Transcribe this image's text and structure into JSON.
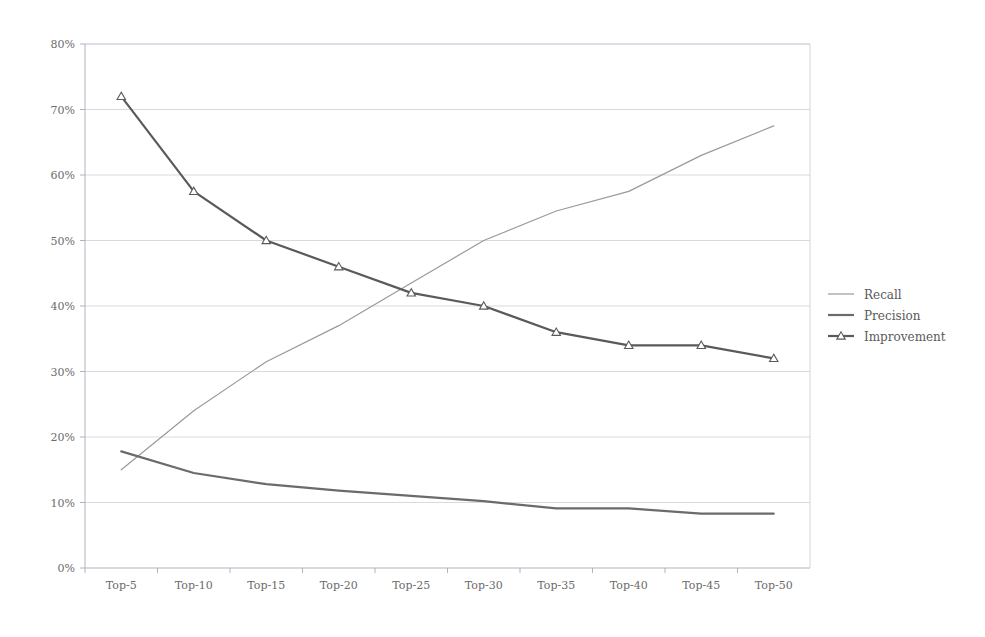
{
  "chart_data": {
    "type": "line",
    "title": "",
    "subtitle": "",
    "xlabel": "",
    "ylabel": "",
    "categories": [
      "Top-5",
      "Top-10",
      "Top-15",
      "Top-20",
      "Top-25",
      "Top-30",
      "Top-35",
      "Top-40",
      "Top-45",
      "Top-50"
    ],
    "ylim": [
      0,
      80
    ],
    "ytick_values": [
      0,
      10,
      20,
      30,
      40,
      50,
      60,
      70,
      80
    ],
    "ytick_labels": [
      "0%",
      "10%",
      "20%",
      "30%",
      "40%",
      "50%",
      "60%",
      "70%",
      "80%"
    ],
    "grid": true,
    "grid_axis": "y",
    "legend_position": "right",
    "units": "percent",
    "series": [
      {
        "name": "Recall",
        "color": "#9a9a9a",
        "width": 1.2,
        "marker": "none",
        "values": [
          15,
          24,
          31.5,
          37,
          43.5,
          50,
          54.5,
          57.5,
          63,
          67.5
        ]
      },
      {
        "name": "Precision",
        "color": "#6b6b6b",
        "width": 2.2,
        "marker": "none",
        "values": [
          17.8,
          14.5,
          12.8,
          11.8,
          11,
          10.2,
          9.1,
          9.1,
          8.3,
          8.3
        ]
      },
      {
        "name": "Improvement",
        "color": "#5a5a5a",
        "width": 2.2,
        "marker": "triangle",
        "values": [
          72,
          57.5,
          50,
          46,
          42,
          40,
          36,
          34,
          34,
          32
        ]
      }
    ]
  },
  "legend": {
    "entries": [
      {
        "label": "Recall"
      },
      {
        "label": "Precision"
      },
      {
        "label": "Improvement"
      }
    ]
  },
  "axes": {
    "y_top_label": "80%",
    "y_bottom_label": "0%",
    "x_first_label": "Top-5",
    "x_last_label": "Top-50"
  }
}
